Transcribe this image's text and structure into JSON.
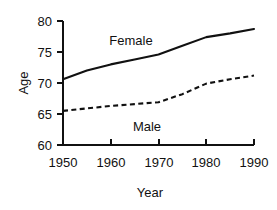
{
  "chart_data": {
    "type": "line",
    "title": "",
    "xlabel": "Year",
    "ylabel": "Age",
    "x": [
      1950,
      1955,
      1960,
      1965,
      1970,
      1975,
      1980,
      1985,
      1990
    ],
    "xlim": [
      1950,
      1990
    ],
    "ylim": [
      60,
      80
    ],
    "xticks": [
      1950,
      1960,
      1970,
      1980,
      1990
    ],
    "yticks": [
      60,
      65,
      70,
      75,
      80
    ],
    "grid": false,
    "legend": "inline-labels",
    "series": [
      {
        "name": "Female",
        "style": "solid",
        "values": [
          70.6,
          72.0,
          73.0,
          73.8,
          74.6,
          76.0,
          77.4,
          78.0,
          78.7
        ]
      },
      {
        "name": "Male",
        "style": "dashed",
        "values": [
          65.5,
          65.9,
          66.3,
          66.6,
          66.9,
          68.2,
          69.9,
          70.6,
          71.2
        ]
      }
    ],
    "annotations": [
      {
        "text": "Female",
        "x": 1962,
        "y": 76.6
      },
      {
        "text": "Male",
        "x": 1968,
        "y": 63.9
      }
    ]
  },
  "axes": {
    "x_tick_labels": [
      "1950",
      "1960",
      "1970",
      "1980",
      "1990"
    ],
    "y_tick_labels": [
      "80",
      "75",
      "70",
      "65",
      "60"
    ],
    "x_axis_title": "Year",
    "y_axis_title": "Age"
  },
  "series_labels": {
    "female": "Female",
    "male": "Male"
  }
}
